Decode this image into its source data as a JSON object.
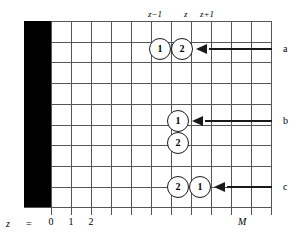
{
  "figure": {
    "colors": {
      "wall": "#000000",
      "grid": "#555555",
      "ink": "#1a1a1a",
      "background": "#ffffff"
    }
  },
  "column_captions": [
    {
      "text": "z−1",
      "x": 148,
      "y": 9
    },
    {
      "text": "z",
      "x": 184,
      "y": 9
    },
    {
      "text": "z+1",
      "x": 200,
      "y": 9
    }
  ],
  "axis": {
    "z_symbol": "z",
    "equals": "=",
    "ticks": [
      {
        "label": "0",
        "x": 51
      },
      {
        "label": "1",
        "x": 71
      },
      {
        "label": "2",
        "x": 91
      }
    ],
    "max_label": "M"
  },
  "grid": {
    "left": 51,
    "right": 271,
    "top": 21,
    "bottom": 207,
    "column_step": 20,
    "row_step": 20.7,
    "n_vertical_lines": 12,
    "n_horizontal_lines": 10
  },
  "wall": {
    "x": 24,
    "y": 21,
    "width": 27,
    "height": 186
  },
  "particles": [
    {
      "label": "1",
      "cx": 160,
      "cy": 49,
      "row": "a"
    },
    {
      "label": "2",
      "cx": 182,
      "cy": 49,
      "row": "a"
    },
    {
      "label": "1",
      "cx": 178,
      "cy": 121,
      "row": "b"
    },
    {
      "label": "2",
      "cx": 178,
      "cy": 143,
      "row": "b"
    },
    {
      "label": "2",
      "cx": 178,
      "cy": 187,
      "row": "c"
    },
    {
      "label": "1",
      "cx": 200,
      "cy": 187,
      "row": "c"
    }
  ],
  "annotations": [
    {
      "label": "a",
      "arrow_y": 49,
      "head_x": 196,
      "line_from": 209,
      "line_to": 272,
      "label_x": 283
    },
    {
      "label": "b",
      "arrow_y": 121,
      "head_x": 192,
      "line_from": 205,
      "line_to": 272,
      "label_x": 283
    },
    {
      "label": "c",
      "arrow_y": 187,
      "head_x": 214,
      "line_from": 227,
      "line_to": 272,
      "label_x": 283
    }
  ]
}
